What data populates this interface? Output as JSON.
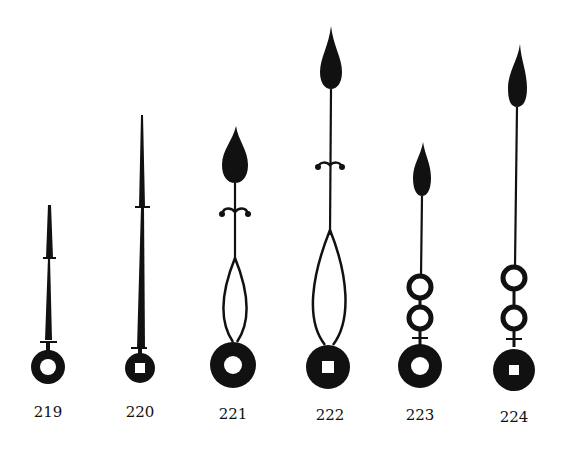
{
  "figure": {
    "ink_color": "#111111",
    "background": "#ffffff"
  },
  "hands": [
    {
      "id": "hand-219",
      "label": "219",
      "style": "plain-tapered",
      "boss_hole": "round"
    },
    {
      "id": "hand-220",
      "label": "220",
      "style": "plain-tapered-long",
      "boss_hole": "square"
    },
    {
      "id": "hand-221",
      "label": "221",
      "style": "spade-loop-scroll",
      "boss_hole": "round"
    },
    {
      "id": "hand-222",
      "label": "222",
      "style": "spade-loop-scroll-long",
      "boss_hole": "square"
    },
    {
      "id": "hand-223",
      "label": "223",
      "style": "spade-double-ring",
      "boss_hole": "round"
    },
    {
      "id": "hand-224",
      "label": "224",
      "style": "spade-double-ring-long",
      "boss_hole": "square"
    }
  ]
}
